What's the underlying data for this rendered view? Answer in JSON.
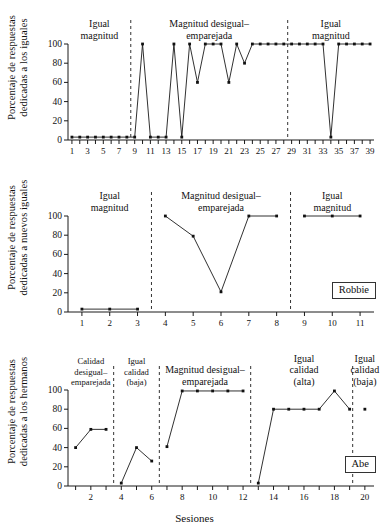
{
  "figure": {
    "x_axis_title": "Sesiones"
  },
  "panels": [
    {
      "id": "panel-top",
      "y_title_line1": "Porcentaje de respuestas",
      "y_title_line2": "dedicadas a los iguales",
      "subject": "",
      "phases": [
        {
          "label": "Igual\nmagnitud",
          "center_session": 4.5
        },
        {
          "label": "Magnitud desigual–\nemparejada",
          "center_session": 18.5
        },
        {
          "label": "Igual\nmagnitud",
          "center_session": 34.0
        }
      ],
      "dividers": [
        8.5,
        28.5
      ],
      "chart_data": {
        "type": "line",
        "title": "",
        "xlabel": "Sesiones",
        "ylabel": "Porcentaje de respuestas dedicadas a los iguales",
        "xlim": [
          0.5,
          39.5
        ],
        "ylim": [
          0,
          100
        ],
        "yticks": [
          0,
          20,
          40,
          60,
          80,
          100
        ],
        "xticks": [
          1,
          2,
          3,
          4,
          5,
          6,
          7,
          8,
          9,
          10,
          11,
          12,
          13,
          14,
          15,
          16,
          17,
          18,
          19,
          20,
          21,
          22,
          23,
          24,
          25,
          26,
          27,
          28,
          29,
          30,
          31,
          32,
          33,
          34,
          35,
          36,
          37,
          38,
          39
        ],
        "xtick_labels_shown": [
          1,
          3,
          5,
          7,
          9,
          11,
          13,
          15,
          17,
          19,
          21,
          23,
          25,
          27,
          29,
          31,
          33,
          35,
          37,
          39
        ],
        "grid": false,
        "legend": "none",
        "series": [
          {
            "name": "Porcentaje",
            "x": [
              1,
              2,
              3,
              4,
              5,
              6,
              7,
              8,
              9,
              10,
              11,
              12,
              13,
              14,
              15,
              16,
              17,
              18,
              19,
              20,
              21,
              22,
              23,
              24,
              25,
              26,
              27,
              28,
              29,
              30,
              31,
              32,
              33,
              34,
              35,
              36,
              37,
              38,
              39
            ],
            "values": [
              3,
              3,
              3,
              3,
              3,
              3,
              3,
              3,
              3,
              100,
              3,
              3,
              3,
              100,
              3,
              100,
              60,
              100,
              100,
              100,
              60,
              100,
              80,
              100,
              100,
              100,
              100,
              100,
              100,
              100,
              100,
              100,
              100,
              3,
              100,
              100,
              100,
              100,
              100
            ]
          }
        ]
      }
    },
    {
      "id": "panel-middle",
      "y_title_line1": "Porcentaje de respuestas",
      "y_title_line2": "dedicadas a nuevos iguales",
      "subject": "Robbie",
      "phases": [
        {
          "label": "Igual\nmagnitud",
          "center_session": 2.0
        },
        {
          "label": "Magnitud desigual–\nemparejada",
          "center_session": 6.0
        },
        {
          "label": "Igual\nmagnitud",
          "center_session": 10.0
        }
      ],
      "dividers": [
        3.5,
        8.5
      ],
      "chart_data": {
        "type": "line",
        "title": "",
        "xlabel": "Sesiones",
        "ylabel": "Porcentaje de respuestas dedicadas a nuevos iguales",
        "xlim": [
          0.5,
          11.5
        ],
        "ylim": [
          0,
          100
        ],
        "yticks": [
          0,
          20,
          40,
          60,
          80,
          100
        ],
        "xticks": [
          1,
          2,
          3,
          4,
          5,
          6,
          7,
          8,
          9,
          10,
          11
        ],
        "xtick_labels_shown": [
          1,
          2,
          3,
          4,
          5,
          6,
          7,
          8,
          9,
          10,
          11
        ],
        "grid": false,
        "legend": "none",
        "series": [
          {
            "name": "Porcentaje",
            "x": [
              1,
              2,
              3,
              4,
              5,
              6,
              7,
              8,
              9,
              10,
              11
            ],
            "values": [
              3,
              3,
              3,
              100,
              79,
              21,
              100,
              100,
              100,
              100,
              100
            ]
          }
        ],
        "segments": [
          [
            1,
            2,
            3
          ],
          [
            4,
            5,
            6,
            7,
            8
          ],
          [
            9,
            10,
            11
          ]
        ]
      }
    },
    {
      "id": "panel-bottom",
      "y_title_line1": "Porcentaje de respuestas",
      "y_title_line2": "dedicadas a los hermanos",
      "subject": "Abe",
      "phases": [
        {
          "label": "Calidad\ndesigual–\nemparejada",
          "center_session": 2.0,
          "small": true
        },
        {
          "label": "Igual\ncalidad\n(baja)",
          "center_session": 5.0,
          "small": true
        },
        {
          "label": "Magnitud desigual–\nemparejada",
          "center_session": 9.5
        },
        {
          "label": "Igual\ncalidad\n(alta)",
          "center_session": 16.0
        },
        {
          "label": "Igual\ncalidad\n(baja)",
          "center_session": 20.0
        }
      ],
      "dividers": [
        3.5,
        6.5,
        12.5,
        19.2
      ],
      "chart_data": {
        "type": "line",
        "title": "",
        "xlabel": "Sesiones",
        "ylabel": "Porcentaje de respuestas dedicadas a los hermanos",
        "xlim": [
          0.5,
          20.6
        ],
        "ylim": [
          0,
          100
        ],
        "yticks": [
          0,
          20,
          40,
          60,
          80,
          100
        ],
        "xticks": [
          1,
          2,
          3,
          4,
          5,
          6,
          7,
          8,
          9,
          10,
          11,
          12,
          13,
          14,
          15,
          16,
          17,
          18,
          19,
          20
        ],
        "xtick_labels_shown": [
          2,
          4,
          6,
          8,
          10,
          12,
          14,
          16,
          18,
          20
        ],
        "grid": false,
        "legend": "none",
        "series": [
          {
            "name": "Porcentaje",
            "x": [
              1,
              2,
              3,
              4,
              5,
              6,
              7,
              8,
              9,
              10,
              11,
              12,
              13,
              14,
              15,
              16,
              17,
              18,
              19,
              20
            ],
            "values": [
              40,
              59,
              59,
              3,
              40,
              26,
              41,
              99,
              99,
              99,
              99,
              99,
              3,
              80,
              80,
              80,
              80,
              99,
              80,
              80
            ]
          }
        ],
        "segments": [
          [
            1,
            2,
            3
          ],
          [
            4,
            5,
            6
          ],
          [
            7,
            8,
            9,
            10,
            11,
            12
          ],
          [
            13,
            14,
            15,
            16,
            17,
            18,
            19
          ],
          [
            20
          ]
        ]
      }
    }
  ]
}
